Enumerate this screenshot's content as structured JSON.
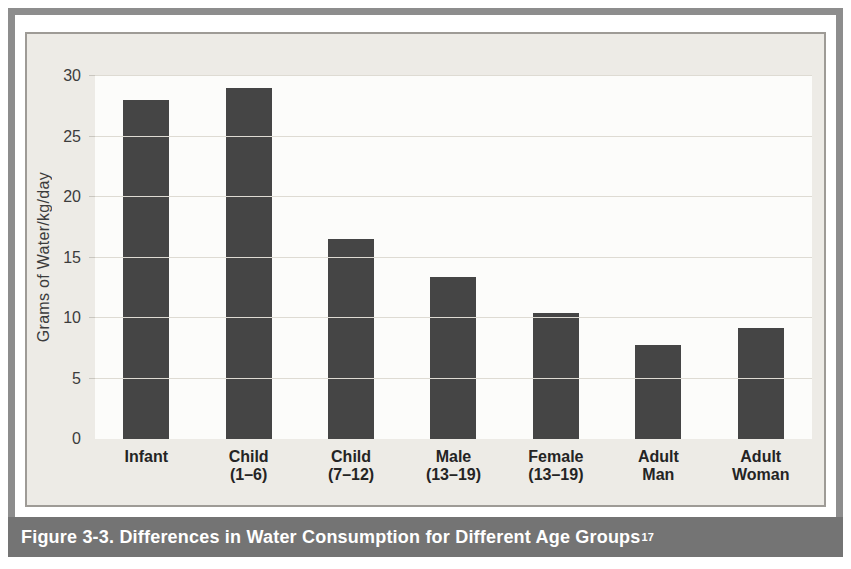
{
  "figure": {
    "caption": "Figure 3-3. Differences in Water Consumption for Different Age Groups",
    "caption_footnote": "17"
  },
  "chart_data": {
    "type": "bar",
    "title": "",
    "categories": [
      "Infant",
      "Child (1–6)",
      "Child (7–12)",
      "Male (13–19)",
      "Female (13–19)",
      "Adult Man",
      "Adult Woman"
    ],
    "category_lines": [
      [
        "Infant"
      ],
      [
        "Child",
        "(1–6)"
      ],
      [
        "Child",
        "(7–12)"
      ],
      [
        "Male",
        "(13–19)"
      ],
      [
        "Female",
        "(13–19)"
      ],
      [
        "Adult",
        "Man"
      ],
      [
        "Adult",
        "Woman"
      ]
    ],
    "values": [
      28,
      29,
      16.5,
      13.4,
      10.4,
      7.8,
      9.2
    ],
    "xlabel": "",
    "ylabel": "Grams of Water/kg/day",
    "yticks": [
      0,
      5,
      10,
      15,
      20,
      25,
      30
    ],
    "ylim": [
      0,
      30
    ],
    "grid": true,
    "legend": "none",
    "colors": {
      "bar": "#454545",
      "plot_bg": "#fcfcfa",
      "chart_bg": "#edebe6",
      "gridline": "#dedbd3",
      "frame": "#8d8d8d",
      "caption_band": "#747474",
      "caption_text": "#ffffff",
      "axis_text": "#3c3c3c",
      "label_text": "#242424"
    }
  }
}
